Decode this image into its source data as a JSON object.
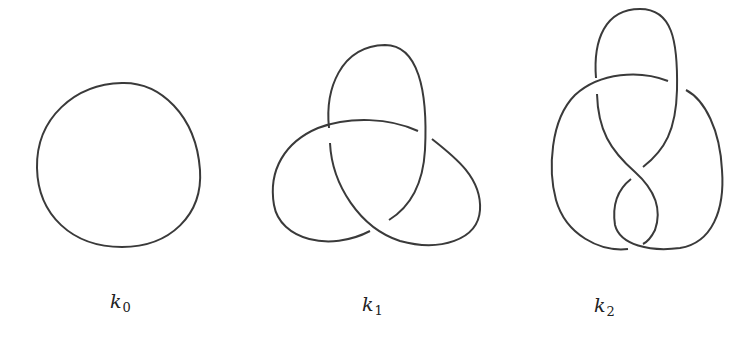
{
  "figure": {
    "stroke_color": "#3a3a3a",
    "background": "#ffffff",
    "knots": [
      {
        "id": "k0",
        "name": "unknot",
        "label_base": "k",
        "label_sub": "0",
        "crossings": 0
      },
      {
        "id": "k1",
        "name": "trefoil",
        "label_base": "k",
        "label_sub": "1",
        "crossings": 3
      },
      {
        "id": "k2",
        "name": "figure-eight",
        "label_base": "k",
        "label_sub": "2",
        "crossings": 4
      }
    ]
  }
}
